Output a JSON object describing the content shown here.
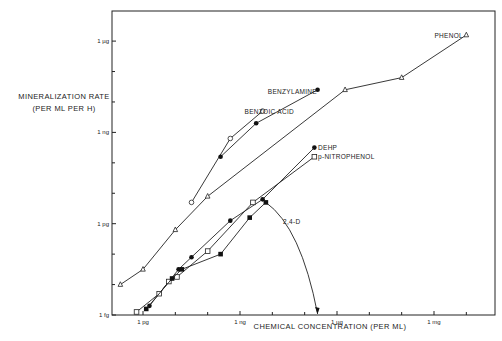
{
  "chart_data": {
    "type": "line",
    "scale": "log-log",
    "title": "",
    "xlabel": "CHEMICAL CONCENTRATION (PER ML)",
    "ylabel": "MINERALIZATION RATE (PER ML PER H)",
    "ylabel_line1": "MINERALIZATION RATE",
    "ylabel_line2": "(PER ML PER H)",
    "units": "log10 grams",
    "x_ticks": [
      {
        "label": "1 pg",
        "value": -12
      },
      {
        "label": "1 ng",
        "value": -9
      },
      {
        "label": "1 µg",
        "value": -6
      },
      {
        "label": "1 mg",
        "value": -3
      }
    ],
    "y_ticks": [
      {
        "label": "1 fg",
        "value": -15
      },
      {
        "label": "1 pg",
        "value": -12
      },
      {
        "label": "1 ng",
        "value": -9
      },
      {
        "label": "1 µg",
        "value": -6
      }
    ],
    "xlim": [
      -12.95,
      -1.2
    ],
    "ylim": [
      -15,
      -5.0
    ],
    "grid": false,
    "legend": "direct labels",
    "series": [
      {
        "name": "PHENOL",
        "marker": "triangle-open",
        "x": [
          -12.7,
          -12.0,
          -11.0,
          -10.0,
          -5.75,
          -4.0,
          -2.0
        ],
        "y": [
          -14.0,
          -13.5,
          -12.2,
          -11.1,
          -7.6,
          -7.2,
          -5.8
        ]
      },
      {
        "name": "BENZOIC ACID",
        "marker": "circle-open",
        "x": [
          -10.5,
          -9.3,
          -8.3
        ],
        "y": [
          -11.3,
          -9.2,
          -8.3
        ]
      },
      {
        "name": "BENZYLAMINE",
        "marker": "circle-filled",
        "x": [
          -9.6,
          -8.5,
          -6.6
        ],
        "y": [
          -9.8,
          -8.7,
          -7.6
        ]
      },
      {
        "name": "DEHP",
        "marker": "circle-filled",
        "x": [
          -11.8,
          -10.9,
          -10.5,
          -9.3,
          -8.3,
          -6.7
        ],
        "y": [
          -14.7,
          -13.5,
          -13.1,
          -11.9,
          -11.2,
          -9.5
        ]
      },
      {
        "name": "p-NITROPHENOL",
        "marker": "square-open",
        "x": [
          -12.2,
          -11.5,
          -11.2,
          -10.95,
          -10.0,
          -8.6,
          -6.7
        ],
        "y": [
          -14.9,
          -14.3,
          -13.9,
          -13.75,
          -12.9,
          -11.3,
          -9.8
        ]
      },
      {
        "name": "2,4-D",
        "marker": "square-filled",
        "x": [
          -11.9,
          -11.1,
          -10.8,
          -9.6,
          -8.7,
          -8.2
        ],
        "y": [
          -14.8,
          -13.8,
          -13.5,
          -13.0,
          -11.8,
          -11.3
        ],
        "annotation": "curve drops sharply to x-axis near 3×10^-7 g (arrow)"
      }
    ]
  },
  "labels": {
    "phenol": "PHENOL",
    "benzylamine": "BENZYLAMINE",
    "benzoic_acid": "BENZOIC ACID",
    "dehp": "DEHP",
    "p_nitrophenol": "p-NITROPHENOL",
    "d24": "2,4-D"
  }
}
